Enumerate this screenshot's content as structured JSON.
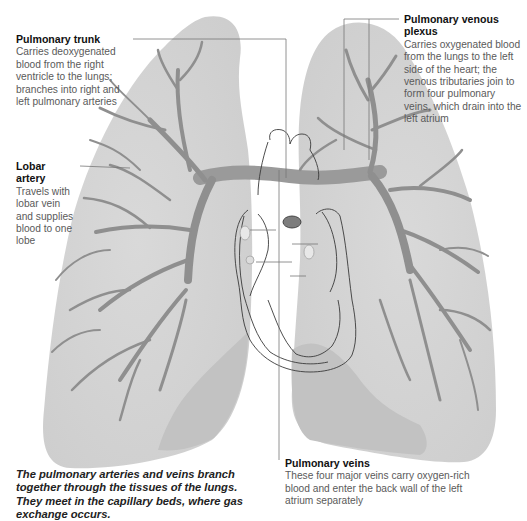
{
  "diagram": {
    "colors": {
      "background": "#ffffff",
      "lung_fill": "#d4d4d4",
      "lung_shadow": "#bdbdbd",
      "vessel": "#8f8f8f",
      "heart_outline": "#3a3a3a",
      "leader_line": "#777777",
      "label_title": "#111111",
      "label_body": "#5a5a5a"
    }
  },
  "callouts": {
    "pulmonary_trunk": {
      "title": "Pulmonary trunk",
      "body": "Carries deoxygenated blood from the right ventricle to the lungs; branches into right and left pulmonary arteries"
    },
    "pulmonary_venous_plexus": {
      "title": "Pulmonary venous plexus",
      "body": "Carries oxygenated blood from the lungs to the left side of the heart; the venous tributaries join to form four pulmonary veins, which drain into the left atrium"
    },
    "lobar_artery": {
      "title": "Lobar artery",
      "body": "Travels with lobar vein and supplies blood to one lobe"
    },
    "pulmonary_veins": {
      "title": "Pulmonary veins",
      "body": "These four major veins carry oxygen-rich blood and enter the back wall of the left atrium separately"
    }
  },
  "caption": "The pulmonary arteries and veins branch together through the tissues of the lungs. They meet in the capillary beds, where gas exchange occurs."
}
